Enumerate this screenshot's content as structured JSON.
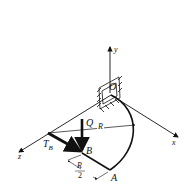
{
  "diagram": {
    "type": "mechanics-3d-bar",
    "labels": {
      "y_axis": "y",
      "x_axis": "x",
      "z_axis": "z",
      "origin": "O",
      "force": "Q",
      "torque": "T",
      "torque_sub": "B",
      "point_b": "B",
      "point_a": "A",
      "radius": "R",
      "half_num": "R",
      "half_den": "2"
    },
    "colors": {
      "ink": "#111111",
      "background": "#ffffff"
    }
  }
}
